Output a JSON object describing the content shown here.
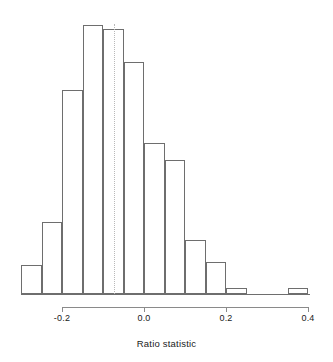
{
  "chart_data": {
    "type": "bar",
    "title": "",
    "xlabel": "Ratio statistic",
    "ylabel": "",
    "binwidth": 0.05,
    "xlim": [
      -0.3,
      0.4
    ],
    "ylim": [
      0,
      269
    ],
    "grid": false,
    "legend": null,
    "axis_ticks": [
      {
        "value": -0.2,
        "label": "-0.2"
      },
      {
        "value": 0.0,
        "label": "0.0"
      },
      {
        "value": 0.2,
        "label": "0.2"
      },
      {
        "value": 0.4,
        "label": "0.4"
      }
    ],
    "annotations": [
      {
        "type": "vertical-dotted-line",
        "value": -0.073,
        "label": ""
      }
    ],
    "bins": [
      {
        "left": -0.3,
        "right": -0.25,
        "count": 27
      },
      {
        "left": -0.25,
        "right": -0.2,
        "count": 67
      },
      {
        "left": -0.2,
        "right": -0.15,
        "count": 190
      },
      {
        "left": -0.15,
        "right": -0.1,
        "count": 250
      },
      {
        "left": -0.1,
        "right": -0.05,
        "count": 246
      },
      {
        "left": -0.05,
        "right": 0.0,
        "count": 216
      },
      {
        "left": 0.0,
        "right": 0.05,
        "count": 140
      },
      {
        "left": 0.05,
        "right": 0.1,
        "count": 125
      },
      {
        "left": 0.1,
        "right": 0.15,
        "count": 50
      },
      {
        "left": 0.15,
        "right": 0.2,
        "count": 30
      },
      {
        "left": 0.2,
        "right": 0.25,
        "count": 6
      },
      {
        "left": 0.25,
        "right": 0.3,
        "count": 0
      },
      {
        "left": 0.3,
        "right": 0.35,
        "count": 0
      },
      {
        "left": 0.35,
        "right": 0.4,
        "count": 6
      }
    ],
    "categories": [
      "-0.30",
      "-0.25",
      "-0.20",
      "-0.15",
      "-0.10",
      "-0.05",
      "0.00",
      "0.05",
      "0.10",
      "0.15",
      "0.20",
      "0.25",
      "0.30",
      "0.35"
    ],
    "values": [
      27,
      67,
      190,
      250,
      246,
      216,
      140,
      125,
      50,
      30,
      6,
      0,
      0,
      6
    ]
  },
  "plot": {
    "px": {
      "baseline_y": 294,
      "x_at_minus_0_2": 62,
      "px_per_unit": 410,
      "max_bar_height": 269,
      "axis_y": 307,
      "tick_len": 5,
      "label_y": 313,
      "xlabel_y": 338
    }
  }
}
